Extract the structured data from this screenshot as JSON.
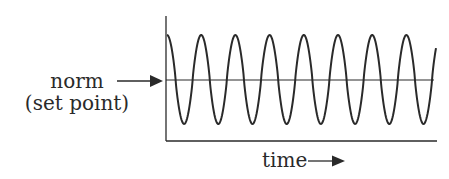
{
  "diagram": {
    "type": "oscillation-around-set-point",
    "labels": {
      "norm": "norm",
      "set_point": "(set point)",
      "time": "time"
    },
    "colors": {
      "ink": "#2a2a2a",
      "background": "#ffffff"
    },
    "wave": {
      "start_x": 167,
      "end_x": 436,
      "period_px": 34.2,
      "peak_y": 35,
      "trough_y": 124,
      "cycles_visible": 8,
      "starts_at": "peak"
    },
    "axes": {
      "y_axis": {
        "x": 166,
        "top": 16,
        "bottom": 141
      },
      "x_axis": {
        "y": 141,
        "left": 166,
        "right": 437
      },
      "norm_line": {
        "y": 80,
        "left": 166,
        "right": 434
      }
    }
  }
}
